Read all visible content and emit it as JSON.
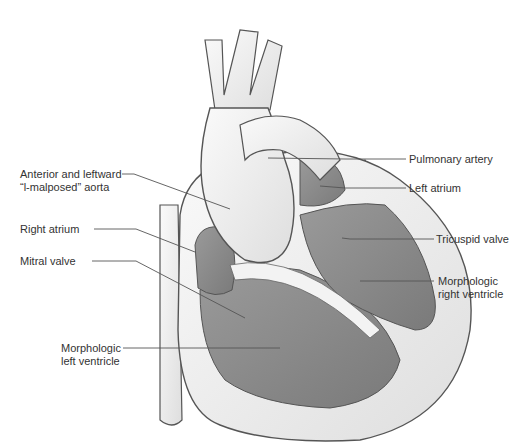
{
  "diagram": {
    "labels": {
      "aorta_line1": "Anterior and leftward",
      "aorta_line2": "“l-malposed” aorta",
      "right_atrium": "Right atrium",
      "mitral_valve": "Mitral valve",
      "lv_line1": "Morphologic",
      "lv_line2": "left ventricle",
      "pulmonary_artery": "Pulmonary artery",
      "left_atrium": "Left atrium",
      "tricuspid_valve": "Tricuspid valve",
      "rv_line1": "Morphologic",
      "rv_line2": "right ventricle"
    },
    "colors": {
      "outer_tissue": "#efefef",
      "chamber": "#8a8a8a",
      "outline": "#555555",
      "leader": "#555555"
    }
  }
}
